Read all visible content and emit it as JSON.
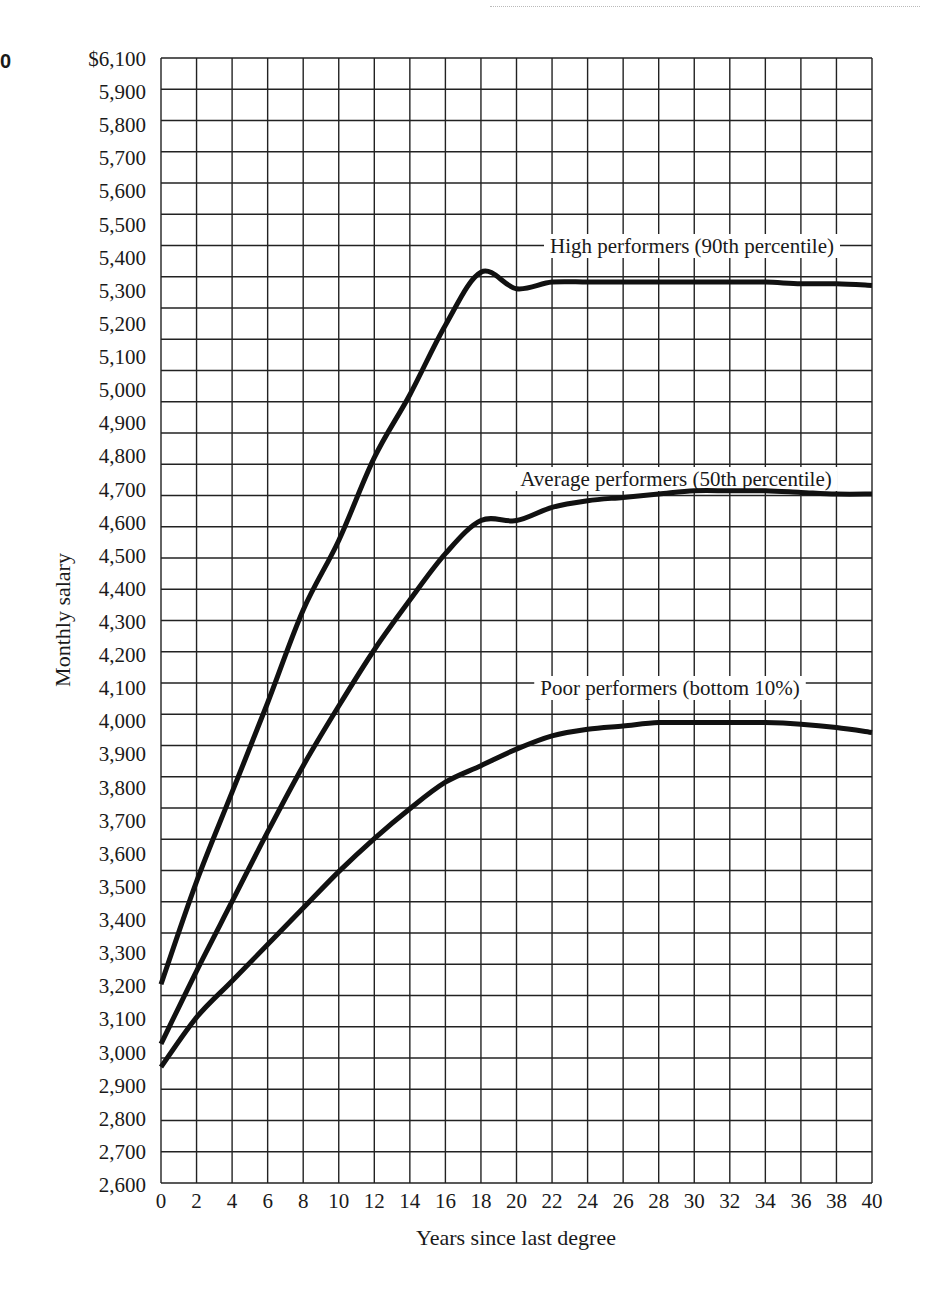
{
  "corner_mark": "0",
  "chart_data": {
    "type": "line",
    "title": "",
    "xlabel": "Years since last degree",
    "ylabel": "Monthly salary",
    "xlim": [
      0,
      40
    ],
    "ylim": [
      2600,
      6100
    ],
    "grid": true,
    "x_ticks": [
      0,
      2,
      4,
      6,
      8,
      10,
      12,
      14,
      16,
      18,
      20,
      22,
      24,
      26,
      28,
      30,
      32,
      34,
      36,
      38,
      40
    ],
    "y_tick_labels": [
      "$6,100",
      "5,900",
      "5,800",
      "5,700",
      "5,600",
      "5,500",
      "5,400",
      "5,300",
      "5,200",
      "5,100",
      "5,000",
      "4,900",
      "4,800",
      "4,700",
      "4,600",
      "4,500",
      "4,400",
      "4,300",
      "4,200",
      "4,100",
      "4,000",
      "3,900",
      "3,800",
      "3,700",
      "3,600",
      "3,500",
      "3,400",
      "3,300",
      "3,200",
      "3,100",
      "3,000",
      "2,900",
      "2,800",
      "2,700",
      "2,600"
    ],
    "x": [
      0,
      2,
      4,
      6,
      8,
      10,
      12,
      14,
      16,
      18,
      20,
      22,
      24,
      26,
      28,
      30,
      32,
      34,
      36,
      38,
      40
    ],
    "series": [
      {
        "name": "High performers (90th percentile)",
        "values": [
          3200,
          3510,
          3780,
          4050,
          4330,
          4540,
          4790,
          4980,
          5190,
          5350,
          5300,
          5320,
          5320,
          5320,
          5320,
          5320,
          5320,
          5320,
          5315,
          5315,
          5310
        ]
      },
      {
        "name": "Average performers (50th percentile)",
        "values": [
          3020,
          3240,
          3450,
          3660,
          3860,
          4040,
          4210,
          4360,
          4500,
          4600,
          4600,
          4640,
          4660,
          4670,
          4680,
          4690,
          4690,
          4690,
          4685,
          4680,
          4680
        ]
      },
      {
        "name": "Poor performers (bottom 10%)",
        "values": [
          2950,
          3100,
          3210,
          3320,
          3430,
          3540,
          3640,
          3730,
          3810,
          3860,
          3910,
          3950,
          3970,
          3980,
          3990,
          3990,
          3990,
          3990,
          3985,
          3975,
          3960
        ]
      }
    ],
    "annotations": [
      {
        "text": "High performers (90th percentile)",
        "x": 28,
        "y": 5420
      },
      {
        "text": "Average performers (50th percentile)",
        "x": 28,
        "y": 4710
      },
      {
        "text": "Poor performers (bottom 10%)",
        "x": 28,
        "y": 4090
      }
    ]
  }
}
